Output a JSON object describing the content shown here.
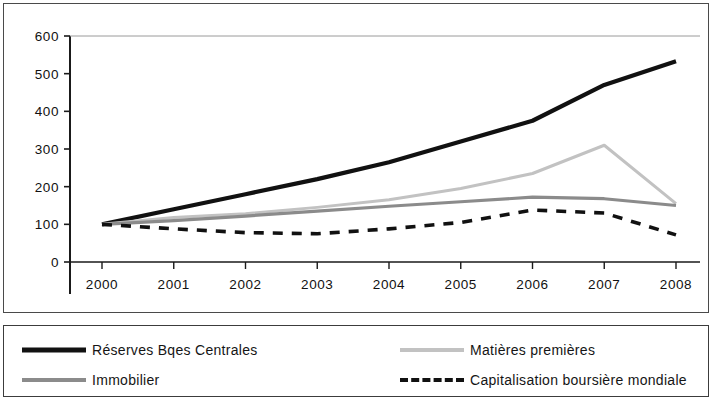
{
  "chart_data": {
    "type": "line",
    "title": "",
    "subtitle": "",
    "xlabel": "",
    "ylabel": "",
    "x": [
      2000,
      2001,
      2002,
      2003,
      2004,
      2005,
      2006,
      2007,
      2008
    ],
    "xtick_labels": [
      "2000",
      "2001",
      "2002",
      "2003",
      "2004",
      "2005",
      "2006",
      "2007",
      "2008"
    ],
    "ytick_labels": [
      "0",
      "100",
      "200",
      "300",
      "400",
      "500",
      "600"
    ],
    "yticks": [
      0,
      100,
      200,
      300,
      400,
      500,
      600
    ],
    "ylim": [
      0,
      600
    ],
    "xlim": [
      2000,
      2008
    ],
    "grid": false,
    "legend_position": "bottom",
    "series": [
      {
        "name": "Réserves Bqes Centrales",
        "color": "#111111",
        "width": 4.2,
        "dash": "none",
        "values": [
          100,
          140,
          180,
          220,
          265,
          320,
          375,
          470,
          533
        ]
      },
      {
        "name": "Matières premières",
        "color": "#c2c2c2",
        "width": 3.0,
        "dash": "none",
        "values": [
          100,
          118,
          128,
          145,
          165,
          195,
          235,
          310,
          155
        ]
      },
      {
        "name": "Immobilier",
        "color": "#8b8b8b",
        "width": 3.2,
        "dash": "none",
        "values": [
          100,
          110,
          122,
          135,
          148,
          160,
          172,
          168,
          150
        ]
      },
      {
        "name": "Capitalisation boursière mondiale",
        "color": "#111111",
        "width": 3.6,
        "dash": "10,9",
        "values": [
          100,
          88,
          78,
          75,
          88,
          105,
          138,
          130,
          72
        ]
      }
    ]
  },
  "legend": {
    "entries": [
      {
        "label": "Réserves Bqes Centrales",
        "swatch": "solid-black-thick"
      },
      {
        "label": "Matières premières",
        "swatch": "solid-lightgray"
      },
      {
        "label": "Immobilier",
        "swatch": "solid-gray"
      },
      {
        "label": "Capitalisation boursière mondiale",
        "swatch": "dashed-black"
      }
    ]
  }
}
